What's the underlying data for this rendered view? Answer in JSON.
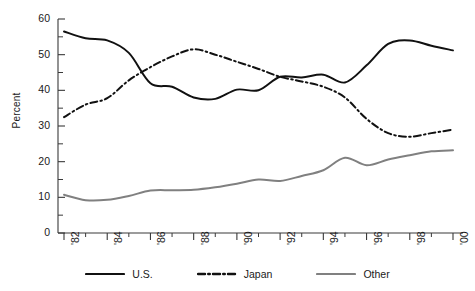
{
  "chart_data": {
    "type": "line",
    "title": "",
    "xlabel": "",
    "ylabel": "Percent",
    "ylim": [
      0,
      60
    ],
    "xlim": [
      1982,
      2000
    ],
    "ytick_labels": [
      "0",
      "10",
      "20",
      "30",
      "40",
      "50",
      "60"
    ],
    "ytick_values": [
      0,
      10,
      20,
      30,
      40,
      50,
      60
    ],
    "yminor_step": 5,
    "xtick_labels": [
      "'82",
      "'84",
      "'86",
      "'88",
      "'90",
      "'92",
      "'94",
      "'96",
      "'98",
      "'00"
    ],
    "xtick_values": [
      1982,
      1984,
      1986,
      1988,
      1990,
      1992,
      1994,
      1996,
      1998,
      2000
    ],
    "xminor_step": 1,
    "grid": false,
    "legend_position": "bottom",
    "x": [
      1982,
      1983,
      1984,
      1985,
      1986,
      1987,
      1988,
      1989,
      1990,
      1991,
      1992,
      1993,
      1994,
      1995,
      1996,
      1997,
      1998,
      1999,
      2000
    ],
    "series": [
      {
        "name": "U.S.",
        "style": "solid",
        "color": "#111111",
        "width": 2.0,
        "values": [
          56.5,
          54.6,
          54.0,
          50.5,
          42.0,
          41.0,
          38.0,
          37.6,
          40.2,
          40.0,
          43.8,
          43.6,
          44.4,
          42.2,
          47.0,
          53.0,
          54.0,
          52.5,
          51.2
        ]
      },
      {
        "name": "Japan",
        "style": "dash-dot",
        "color": "#111111",
        "width": 2.0,
        "values": [
          32.5,
          36.0,
          37.8,
          42.8,
          46.5,
          49.5,
          51.5,
          50.0,
          48.0,
          46.0,
          43.8,
          42.5,
          41.0,
          38.0,
          32.0,
          28.0,
          27.0,
          28.0,
          29.0
        ]
      },
      {
        "name": "Other",
        "style": "solid",
        "color": "#808080",
        "width": 2.0,
        "values": [
          10.7,
          9.2,
          9.3,
          10.4,
          11.9,
          12.0,
          12.1,
          12.8,
          13.8,
          15.0,
          14.6,
          16.0,
          17.6,
          21.1,
          19.0,
          20.6,
          21.8,
          22.9,
          23.2
        ]
      }
    ]
  },
  "legend": {
    "items": [
      {
        "label": "U.S.",
        "style": "solid",
        "color": "#111111"
      },
      {
        "label": "Japan",
        "style": "dash-dot",
        "color": "#111111"
      },
      {
        "label": "Other",
        "style": "solid",
        "color": "#808080"
      }
    ]
  }
}
